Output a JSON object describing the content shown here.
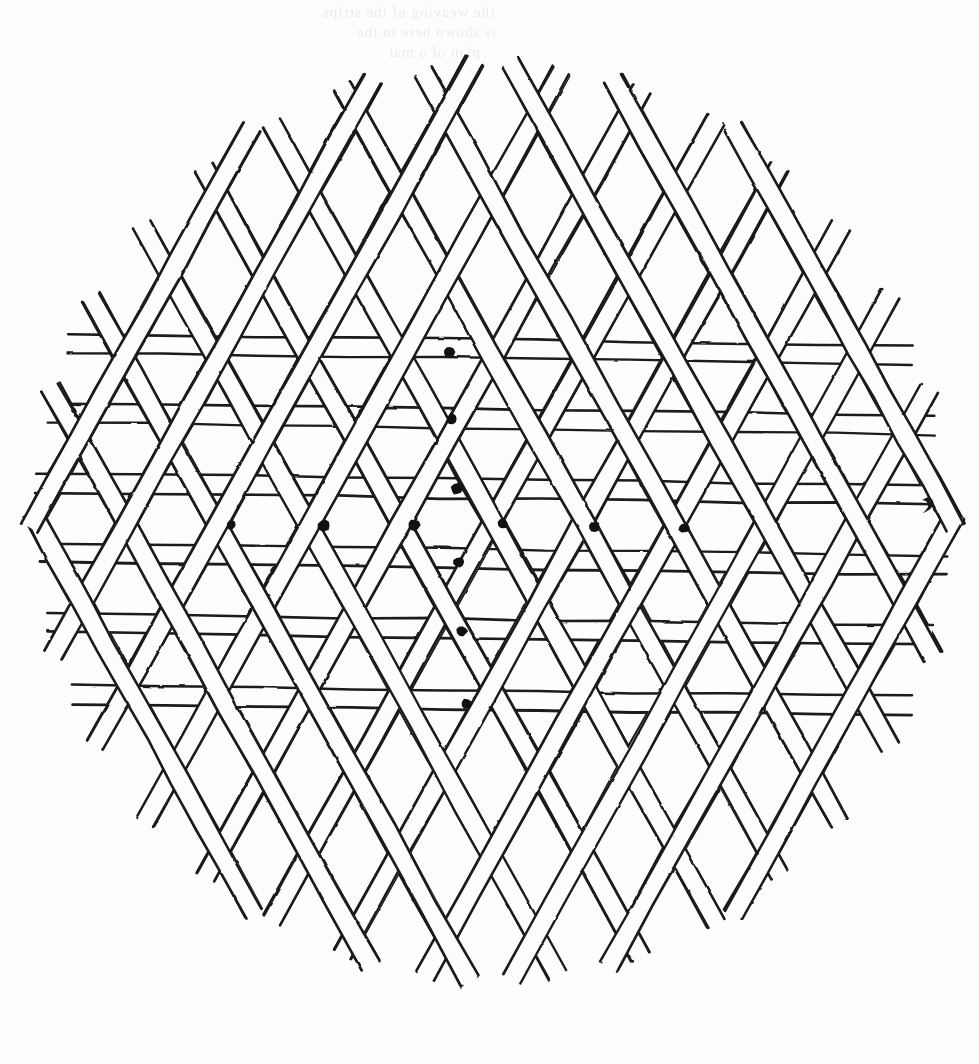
{
  "page": {
    "width": 979,
    "height": 1064,
    "background_color": "#fdfdfc",
    "ink_color": "#1a1a1a",
    "caption": ""
  },
  "figure": {
    "title": "",
    "type": "triaxial-weave-lattice",
    "strip_width": 19,
    "line_weight": 2.6,
    "families": [
      {
        "name": "horizontal",
        "angle_deg": 0.8,
        "count": 6,
        "label": "horizontal-strips"
      },
      {
        "name": "diagonal-right",
        "angle_deg": -61,
        "count": 17,
        "label": "up-right-strips"
      },
      {
        "name": "diagonal-left",
        "angle_deg": 61,
        "count": 17,
        "label": "up-left-strips"
      }
    ],
    "center": {
      "x": 492,
      "y": 522
    },
    "radius": 462
  },
  "horizontal_strips": {
    "label": "horizontal-strip",
    "y_positions": [
      349,
      419,
      489,
      559,
      629,
      700
    ],
    "spacing": 70
  },
  "diagonals": {
    "label": "diagonal-strip",
    "spacing": 80,
    "angle_right_deg": -61,
    "angle_left_deg": 61,
    "offsets": [
      -640,
      -560,
      -480,
      -400,
      -320,
      -240,
      -160,
      -80,
      0,
      80,
      160,
      240,
      320,
      400,
      480,
      560,
      640
    ]
  },
  "marks": {
    "label": "crossing-marker",
    "color": "#111111",
    "radius": 5.5,
    "row_label": "horizontal-dot-row",
    "column_label": "vertical-dot-column",
    "row": [
      {
        "x": 231,
        "y": 525,
        "r": 5.0
      },
      {
        "x": 324,
        "y": 526,
        "r": 6.0
      },
      {
        "x": 414,
        "y": 525,
        "r": 5.8
      },
      {
        "x": 503,
        "y": 524,
        "r": 5.0
      },
      {
        "x": 594,
        "y": 527,
        "r": 5.8
      },
      {
        "x": 684,
        "y": 528,
        "r": 5.2
      }
    ],
    "column": [
      {
        "x": 449,
        "y": 352,
        "r": 5.6
      },
      {
        "x": 452,
        "y": 419,
        "r": 5.2
      },
      {
        "x": 457,
        "y": 489,
        "r": 5.8
      },
      {
        "x": 459,
        "y": 562,
        "r": 5.4
      },
      {
        "x": 462,
        "y": 631,
        "r": 5.4
      },
      {
        "x": 467,
        "y": 704,
        "r": 5.2
      }
    ],
    "total_count": 12
  },
  "artifacts": {
    "ink_mark": {
      "label": "stray-ink-comma",
      "x": 928,
      "y": 504
    },
    "bleed_through": {
      "label": "reverse-side-show-through",
      "lines": [
        "the  weaving  of  the  strips",
        "is  shown  here  in  the",
        "plan  of  a  mat"
      ],
      "positions": [
        {
          "x": 322,
          "y": 6
        },
        {
          "x": 356,
          "y": 26
        },
        {
          "x": 388,
          "y": 46
        }
      ]
    }
  }
}
